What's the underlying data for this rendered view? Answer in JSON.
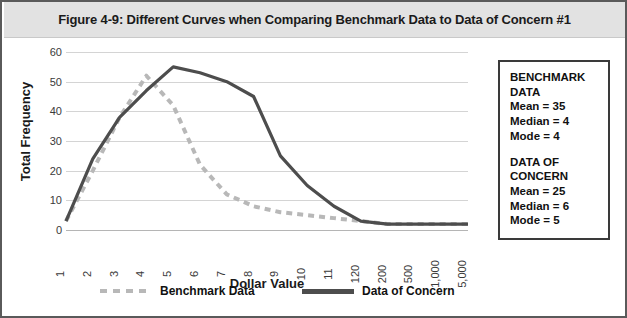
{
  "figure": {
    "title": "Figure 4-9: Different Curves when Comparing Benchmark Data to Data of Concern #1"
  },
  "stats_box": {
    "benchmark": {
      "heading": "BENCHMARK DATA",
      "mean": "Mean = 35",
      "median": "Median = 4",
      "mode": "Mode = 4"
    },
    "concern": {
      "heading_line1": "DATA OF",
      "heading_line2": "CONCERN",
      "mean": "Mean = 25",
      "median": "Median = 6",
      "mode": "Mode = 5"
    }
  },
  "legend": {
    "benchmark_label": "Benchmark Data",
    "concern_label": "Data of Concern"
  },
  "colors": {
    "benchmark_line": "#b8b8b8",
    "concern_line": "#4d4d4d",
    "gridline": "#d4d4d4",
    "title_band": "#e2e2e2",
    "border": "#5a5a5a",
    "text": "#111111"
  },
  "chart_data": {
    "type": "line",
    "title": "Figure 4-9: Different Curves when Comparing Benchmark Data to Data of Concern #1",
    "xlabel": "Dollar Value",
    "ylabel": "Total Frequency",
    "categories": [
      "1",
      "2",
      "3",
      "4",
      "5",
      "6",
      "7",
      "8",
      "9",
      "10",
      "11",
      "120",
      "200",
      "500",
      "1,000",
      "5,000"
    ],
    "ylim": [
      0,
      60
    ],
    "yticks": [
      0,
      10,
      20,
      30,
      40,
      50,
      60
    ],
    "grid": true,
    "legend_position": "bottom",
    "series": [
      {
        "name": "Benchmark Data",
        "style": "dashed",
        "color": "#b8b8b8",
        "values": [
          3,
          20,
          38,
          52,
          42,
          22,
          12,
          8,
          6,
          5,
          4,
          3,
          2,
          2,
          2,
          2
        ]
      },
      {
        "name": "Data of Concern",
        "style": "solid",
        "color": "#4d4d4d",
        "values": [
          3,
          24,
          38,
          47,
          55,
          53,
          50,
          45,
          25,
          15,
          8,
          3,
          2,
          2,
          2,
          2
        ]
      }
    ]
  }
}
